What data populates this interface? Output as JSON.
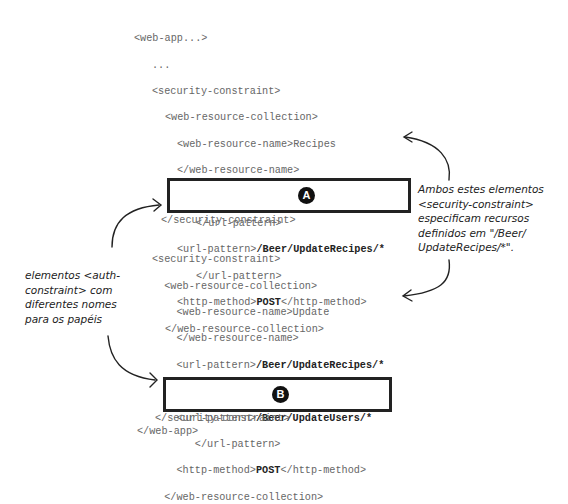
{
  "block1": {
    "lines": [
      {
        "indent": 0,
        "pre": "<web-app...>",
        "bold": "",
        "post": ""
      },
      {
        "indent": 1,
        "pre": "...",
        "bold": "",
        "post": ""
      },
      {
        "indent": 1,
        "pre": "<security-constraint>",
        "bold": "",
        "post": ""
      },
      {
        "indent": 2,
        "pre": "<web-resource-collection>",
        "bold": "",
        "post": ""
      },
      {
        "indent": 3,
        "pre": "<web-resource-name>Recipes",
        "bold": "",
        "post": ""
      },
      {
        "indent": 3,
        "pre": "</web-resource-name>",
        "bold": "",
        "post": ""
      },
      {
        "indent": 3,
        "pre": "<url-pattern>",
        "bold": "/Beer/DisplayRecipes/*",
        "post": ""
      },
      {
        "indent": 5,
        "pre": "</url-pattern>",
        "bold": "",
        "post": ""
      },
      {
        "indent": 3,
        "pre": "<url-pattern>",
        "bold": "/Beer/UpdateRecipes/*",
        "post": ""
      },
      {
        "indent": 5,
        "pre": "</url-pattern>",
        "bold": "",
        "post": ""
      },
      {
        "indent": 3,
        "pre": "<http-method>",
        "bold": "POST",
        "post": "</http-method>"
      },
      {
        "indent": 2,
        "pre": "</web-resource-collection>",
        "bold": "",
        "post": ""
      }
    ],
    "box_label": "A",
    "closing": "</security-constraint>"
  },
  "block2": {
    "lines": [
      {
        "pre": "<security-constraint>",
        "bold": "",
        "post": ""
      },
      {
        "pre": "  <web-resource-collection>",
        "bold": "",
        "post": ""
      },
      {
        "pre": "    <web-resource-name>Update",
        "bold": "",
        "post": ""
      },
      {
        "pre": "    </web-resource-name>",
        "bold": "",
        "post": ""
      },
      {
        "pre": "    <url-pattern>",
        "bold": "/Beer/UpdateRecipes/*",
        "post": ""
      },
      {
        "pre": "       </url-pattern>",
        "bold": "",
        "post": ""
      },
      {
        "pre": "    <url-pattern>",
        "bold": "/Beer/UpdateUsers/*",
        "post": ""
      },
      {
        "pre": "       </url-pattern>",
        "bold": "",
        "post": ""
      },
      {
        "pre": "    <http-method>",
        "bold": "POST",
        "post": "</http-method>"
      },
      {
        "pre": "  </web-resource-collection>",
        "bold": "",
        "post": ""
      }
    ],
    "box_label": "B",
    "closing": "</security-constraint>",
    "end": "</web-app>"
  },
  "notes": {
    "right": "Ambos estes elementos\n<security-constraint>\nespecificam recursos\ndefinidos em \"/Beer/\nUpdateRecipes/*\".",
    "left": "elementos <auth-\nconstraint> com\ndiferentes nomes\npara os papéis"
  }
}
